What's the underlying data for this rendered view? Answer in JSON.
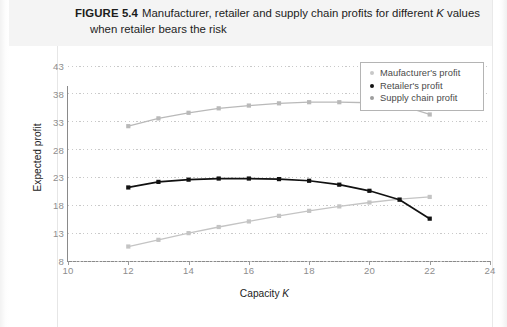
{
  "figure": {
    "label": "FIGURE 5.4",
    "caption_line1_a": "Manufacturer, retailer and supply chain profits for different ",
    "caption_line1_k": "K",
    "caption_line1_b": " values",
    "caption_line2": "when retailer bears the risk"
  },
  "legend": {
    "position": "top-right",
    "items": [
      {
        "label": "Maufacturer's profit",
        "color": "#c8c8c8",
        "marker": "dot"
      },
      {
        "label": "Retailer's profit",
        "color": "#111111",
        "marker": "dot"
      },
      {
        "label": "Supply chain profit",
        "color": "#9e9e9e",
        "marker": "dot"
      }
    ]
  },
  "axes": {
    "xlabel_a": "Capacity ",
    "xlabel_k": "K",
    "ylabel": "Expected profit",
    "xticks": [
      10,
      12,
      14,
      16,
      18,
      20,
      22,
      24
    ],
    "yticks": [
      8,
      13,
      18,
      23,
      28,
      33,
      38,
      43
    ],
    "xlim": [
      10,
      24
    ],
    "ylim": [
      8,
      43
    ],
    "grid": "horizontal-dotted"
  },
  "chart_data": {
    "type": "line",
    "title": "Manufacturer, retailer and supply chain profits for different K values when retailer bears the risk",
    "xlabel": "Capacity K",
    "ylabel": "Expected profit",
    "xlim": [
      10,
      24
    ],
    "ylim": [
      8,
      43
    ],
    "grid": true,
    "legend_position": "top-right",
    "x": [
      12,
      13,
      14,
      15,
      16,
      17,
      18,
      19,
      20,
      21,
      22
    ],
    "series": [
      {
        "name": "Maufacturer's profit",
        "color": "#c4c4c4",
        "marker": "square",
        "values": [
          10.6,
          11.8,
          13.0,
          14.1,
          15.1,
          16.1,
          17.0,
          17.8,
          18.5,
          19.1,
          19.5
        ]
      },
      {
        "name": "Retailer's profit",
        "color": "#111111",
        "marker": "square",
        "values": [
          21.2,
          22.2,
          22.6,
          22.8,
          22.8,
          22.7,
          22.4,
          21.7,
          20.6,
          19.0,
          15.6
        ]
      },
      {
        "name": "Supply chain profit",
        "color": "#b9b9b9",
        "marker": "square",
        "values": [
          32.2,
          33.6,
          34.6,
          35.4,
          35.9,
          36.3,
          36.5,
          36.5,
          36.4,
          36.0,
          34.3
        ]
      }
    ]
  }
}
